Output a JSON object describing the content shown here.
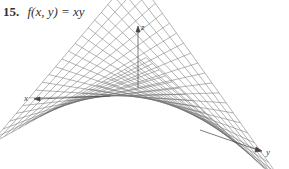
{
  "exercise": {
    "number": "15.",
    "function": "f(x, y) = xy"
  },
  "figure": {
    "type": "3d-wireframe-surface",
    "surface": "hyperbolic-paraboloid (saddle)",
    "axes": {
      "x_label": "x",
      "y_label": "y",
      "z_label": "z"
    },
    "line_color": "#6a6a6a",
    "axis_color": "#444444"
  }
}
